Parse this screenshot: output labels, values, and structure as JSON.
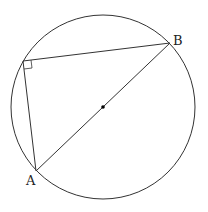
{
  "diagram": {
    "type": "geometry",
    "circle": {
      "cx": 103,
      "cy": 107,
      "r": 92
    },
    "points": {
      "A": {
        "label": "A",
        "x": 36,
        "y": 171
      },
      "B": {
        "label": "B",
        "x": 170,
        "y": 43
      },
      "C": {
        "label": "",
        "x": 23,
        "y": 61
      }
    },
    "center": {
      "x": 103,
      "y": 107
    },
    "right_angle_at": "C",
    "colors": {
      "stroke": "#333333",
      "background": "#ffffff"
    }
  }
}
